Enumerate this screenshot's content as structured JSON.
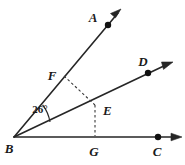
{
  "figure": {
    "background_color": "#ffffff",
    "stroke_color": "#262626",
    "dash_color": "#3a3a3a"
  },
  "labels": {
    "a": "A",
    "b": "B",
    "c": "C",
    "d": "D",
    "e": "E",
    "f": "F",
    "g": "G",
    "angle_abd": "26°"
  },
  "geometry": {
    "points": {
      "B": {
        "x": 14,
        "y": 137
      },
      "A": {
        "x": 108,
        "y": 25
      },
      "D": {
        "x": 148,
        "y": 73
      },
      "C": {
        "x": 158,
        "y": 137
      },
      "E": {
        "x": 95,
        "y": 105
      },
      "F": {
        "x": 64,
        "y": 76
      },
      "G": {
        "x": 95,
        "y": 137
      }
    },
    "rays": [
      {
        "name": "ray-BA",
        "from": "B",
        "through": "A",
        "tip_x": 121,
        "tip_y": 9
      },
      {
        "name": "ray-BD",
        "from": "B",
        "through": "D",
        "tip_x": 172,
        "tip_y": 62
      },
      {
        "name": "ray-BC",
        "from": "B",
        "through": "C",
        "tip_x": 181,
        "tip_y": 137
      }
    ],
    "dashed_segments": [
      {
        "name": "segment-FE",
        "from": "F",
        "to": "E"
      },
      {
        "name": "segment-EG",
        "from": "E",
        "to": "G"
      }
    ],
    "angle_arc": {
      "vertex": "B",
      "between": [
        "ray-BA",
        "ray-BD"
      ],
      "measure_text": "26°",
      "label_x": 40,
      "label_y": 110
    }
  }
}
